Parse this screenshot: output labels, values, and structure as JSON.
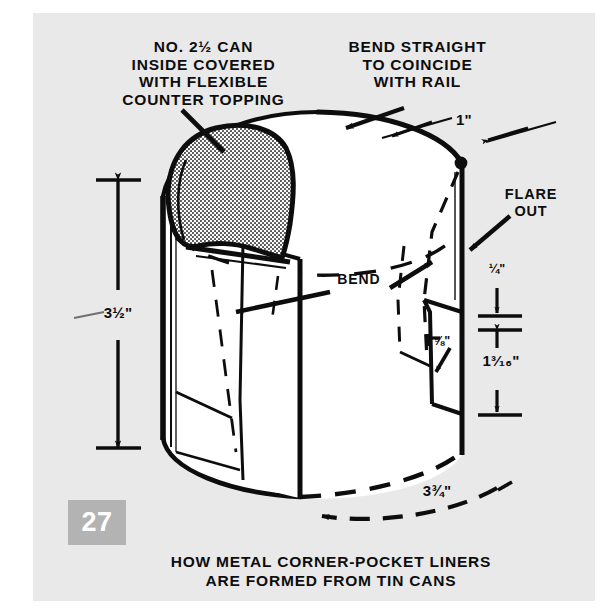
{
  "figure": {
    "page_number": "27",
    "background_color": "#e9e9e9",
    "ink_color": "#0d0d0d",
    "page_box_color": "#b3b3b3"
  },
  "callouts": {
    "top_left": "NO. 2½ CAN\nINSIDE COVERED\nWITH FLEXIBLE\nCOUNTER TOPPING",
    "top_right": "BEND STRAIGHT\nTO COINCIDE\nWITH RAIL",
    "flare": "FLARE\nOUT",
    "bend": "BEND"
  },
  "dimensions": {
    "height": "3½\"",
    "top_flange": "1\"",
    "flare_gap": "¼\"",
    "tab_width": "⅝\"",
    "tab_height": "1³⁄₁₆\"",
    "diameter": "3¾\""
  },
  "caption": {
    "line1": "HOW METAL CORNER-POCKET LINERS",
    "line2": "ARE FORMED FROM TIN CANS"
  }
}
